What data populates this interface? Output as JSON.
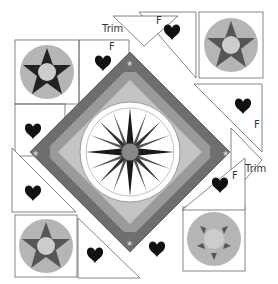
{
  "diagram": {
    "labels": {
      "trim_top": "Trim",
      "trim_right": "Trim",
      "f_top_left": "F",
      "f_top_right": "F",
      "f_right": "F",
      "f_bottom_right": "F"
    },
    "colors": {
      "background": "#ffffff",
      "outline": "#666666",
      "medallion_outer": "#b5b5b5",
      "medallion_center": "#cccccc",
      "star": "#444444",
      "heart": "#111111",
      "border_dark": "#6e6e6e",
      "border_mid": "#9a9a9a",
      "border_light": "#c4c4c4",
      "compass_ring": "#ffffff",
      "compass_point_dark": "#1a1a1a",
      "compass_point_mid": "#555555"
    },
    "blocks": {
      "star_medallions": [
        "top-left",
        "top-right",
        "bottom-left",
        "bottom-right"
      ],
      "heart_units": 8,
      "compass_points": 16
    }
  }
}
